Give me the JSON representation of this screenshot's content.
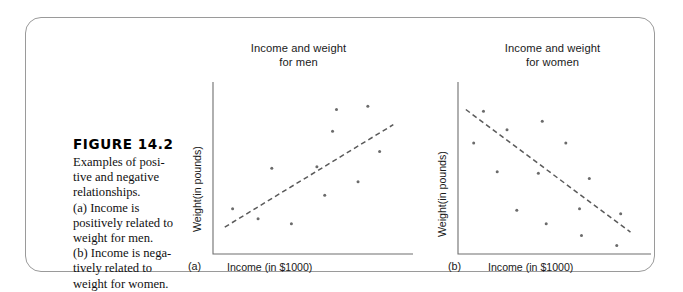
{
  "figure": {
    "number_label": "FIGURE 14.2",
    "caption_lines": [
      "Examples of posi-",
      "tive and negative",
      "relationships.",
      "(a) Income is",
      "positively related to",
      "weight for men.",
      "(b) Income is nega-",
      "tively related to",
      "weight for women."
    ],
    "frame_color": "#9a9a9a"
  },
  "chart_data": [
    {
      "type": "scatter",
      "panel_tag": "(a)",
      "title": "Income and weight\nfor men",
      "title_line1": "Income and weight",
      "title_line2": "for men",
      "xlabel": "Income (in $1000)",
      "ylabel": "Weight(in pounds)",
      "grid": false,
      "axis_ticks": false,
      "relationship": "positive",
      "xlim": [
        0,
        100
      ],
      "ylim": [
        0,
        100
      ],
      "point_color": "#6b6b6b",
      "trend_color": "#5a5a5a",
      "trend_style": "dashed",
      "trendline": {
        "x1": 6,
        "y1": 16,
        "x2": 92,
        "y2": 77
      },
      "points": [
        {
          "x": 10,
          "y": 27
        },
        {
          "x": 23,
          "y": 21
        },
        {
          "x": 30,
          "y": 51
        },
        {
          "x": 40,
          "y": 18
        },
        {
          "x": 53,
          "y": 52
        },
        {
          "x": 57,
          "y": 35
        },
        {
          "x": 63,
          "y": 86
        },
        {
          "x": 61,
          "y": 73
        },
        {
          "x": 74,
          "y": 43
        },
        {
          "x": 79,
          "y": 88
        },
        {
          "x": 85,
          "y": 61
        }
      ]
    },
    {
      "type": "scatter",
      "panel_tag": "(b)",
      "title": "Income and weight\nfor women",
      "title_line1": "Income and weight",
      "title_line2": "for women",
      "xlabel": "Income (in $1000)",
      "ylabel": "Weight(in pounds)",
      "grid": false,
      "axis_ticks": false,
      "relationship": "negative",
      "xlim": [
        0,
        100
      ],
      "ylim": [
        0,
        100
      ],
      "point_color": "#6b6b6b",
      "trend_color": "#5a5a5a",
      "trend_style": "dashed",
      "trendline": {
        "x1": 4,
        "y1": 86,
        "x2": 88,
        "y2": 13
      },
      "points": [
        {
          "x": 13,
          "y": 85
        },
        {
          "x": 8,
          "y": 66
        },
        {
          "x": 25,
          "y": 74
        },
        {
          "x": 43,
          "y": 79
        },
        {
          "x": 20,
          "y": 49
        },
        {
          "x": 55,
          "y": 66
        },
        {
          "x": 41,
          "y": 48
        },
        {
          "x": 67,
          "y": 45
        },
        {
          "x": 30,
          "y": 26
        },
        {
          "x": 45,
          "y": 18
        },
        {
          "x": 62,
          "y": 27
        },
        {
          "x": 63,
          "y": 11
        },
        {
          "x": 83,
          "y": 24
        },
        {
          "x": 81,
          "y": 5
        }
      ]
    }
  ]
}
